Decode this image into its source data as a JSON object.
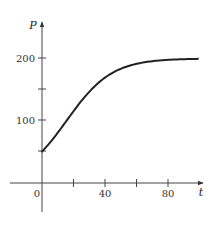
{
  "chart_data": {
    "type": "line",
    "title": "",
    "xlabel": "t",
    "ylabel": "P",
    "xlim": [
      -17,
      103
    ],
    "ylim": [
      -48,
      260
    ],
    "grid": false,
    "legend": null,
    "x_ticks": [
      0,
      20,
      40,
      60,
      80
    ],
    "x_tick_labels": [
      "0",
      "",
      "40",
      "",
      "80"
    ],
    "y_ticks": [
      50,
      100,
      150,
      200
    ],
    "y_tick_labels": [
      "",
      "100",
      "",
      "200"
    ],
    "series": [
      {
        "name": "P(t)",
        "description": "Logistic growth curve P = 200 / (1 + 3e^(-0.07t))",
        "x": [
          0,
          5,
          10,
          15,
          20,
          25,
          30,
          35,
          40,
          45,
          50,
          55,
          60,
          65,
          70,
          75,
          80,
          85,
          90,
          99
        ],
        "y": [
          50,
          63,
          78,
          94,
          111,
          127,
          142,
          156,
          169,
          178,
          186,
          191,
          195,
          197,
          198,
          199,
          199.5,
          200,
          200,
          200
        ]
      }
    ],
    "annotations": []
  },
  "labels": {
    "y_axis": "P",
    "x_axis": "t",
    "origin": "0",
    "y_100": "100",
    "y_200": "200",
    "x_40": "40",
    "x_80": "80"
  }
}
